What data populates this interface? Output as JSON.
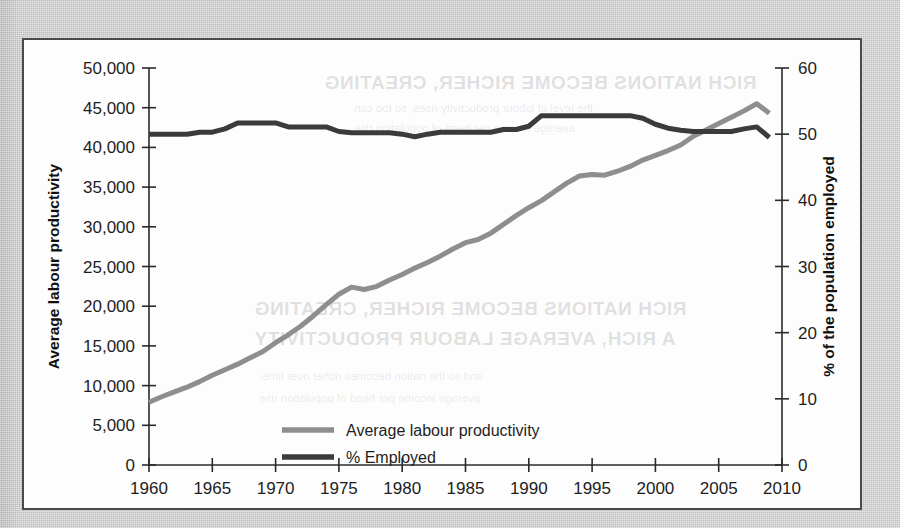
{
  "figure": {
    "background_color": "#cfcfcf",
    "card_color": "#fdfdfd",
    "border_color": "#4a4a4a"
  },
  "ghost_text": {
    "line1": "RICH NATIONS BECOME RICHER, CREATING",
    "line2": "A RICH, AVERAGE LABOUR PRODUCTIVITY",
    "line3": "the level of labour productivity rises, so too can",
    "line4": "average income per head of population rise",
    "line5": "and so the nation becomes richer over time."
  },
  "chart_data": {
    "type": "line",
    "title": "",
    "subtitle": "",
    "xlabel": "",
    "ylabel": "Average labour productivity",
    "y2label": "% of the population employed",
    "grid": false,
    "legend_position": "inside-bottom-right",
    "xlim": [
      1960,
      2010
    ],
    "ylim": [
      0,
      50000
    ],
    "y2lim": [
      0,
      60
    ],
    "xticks": [
      1960,
      1965,
      1970,
      1975,
      1980,
      1985,
      1990,
      1995,
      2000,
      2005,
      2010
    ],
    "xticklabels": [
      "1960",
      "1965",
      "1970",
      "1975",
      "1980",
      "1985",
      "1990",
      "1995",
      "2000",
      "2005",
      "2010"
    ],
    "yticks": [
      0,
      5000,
      10000,
      15000,
      20000,
      25000,
      30000,
      35000,
      40000,
      45000,
      50000
    ],
    "yticklabels": [
      "0",
      "5,000",
      "10,000",
      "15,000",
      "20,000",
      "25,000",
      "30,000",
      "35,000",
      "40,000",
      "45,000",
      "50,000"
    ],
    "y2ticks": [
      0,
      10,
      20,
      30,
      40,
      50,
      60
    ],
    "y2ticklabels": [
      "0",
      "10",
      "20",
      "30",
      "40",
      "50",
      "60"
    ],
    "x": [
      1960,
      1961,
      1962,
      1963,
      1964,
      1965,
      1966,
      1967,
      1968,
      1969,
      1970,
      1971,
      1972,
      1973,
      1974,
      1975,
      1976,
      1977,
      1978,
      1979,
      1980,
      1981,
      1982,
      1983,
      1984,
      1985,
      1986,
      1987,
      1988,
      1989,
      1990,
      1991,
      1992,
      1993,
      1994,
      1995,
      1996,
      1997,
      1998,
      1999,
      2000,
      2001,
      2002,
      2003,
      2004,
      2005,
      2006,
      2007,
      2008,
      2009
    ],
    "series": [
      {
        "name": "Average labour productivity",
        "axis": "left",
        "color": "#8e8e8e",
        "values": [
          7900,
          8600,
          9200,
          9800,
          10500,
          11300,
          12000,
          12700,
          13500,
          14300,
          15400,
          16400,
          17500,
          18800,
          20200,
          21500,
          22400,
          22100,
          22500,
          23300,
          24000,
          24800,
          25500,
          26300,
          27200,
          28000,
          28400,
          29200,
          30300,
          31400,
          32400,
          33300,
          34400,
          35500,
          36400,
          36600,
          36500,
          37000,
          37600,
          38400,
          39000,
          39600,
          40300,
          41400,
          42200,
          43000,
          43800,
          44600,
          45500,
          44300
        ]
      },
      {
        "name": "% Employed",
        "axis": "right",
        "color": "#3b3b3b",
        "values": [
          50.0,
          50.0,
          50.0,
          50.0,
          50.3,
          50.3,
          50.8,
          51.7,
          51.7,
          51.7,
          51.7,
          51.1,
          51.1,
          51.1,
          51.1,
          50.4,
          50.2,
          50.2,
          50.2,
          50.2,
          50.0,
          49.6,
          50.0,
          50.3,
          50.3,
          50.3,
          50.3,
          50.3,
          50.7,
          50.7,
          51.2,
          52.8,
          52.8,
          52.8,
          52.8,
          52.8,
          52.8,
          52.8,
          52.8,
          52.4,
          51.5,
          50.9,
          50.6,
          50.4,
          50.4,
          50.4,
          50.4,
          50.8,
          51.1,
          49.5
        ]
      }
    ],
    "legend": [
      {
        "label": "Average labour productivity",
        "color": "#8e8e8e"
      },
      {
        "label": "% Employed",
        "color": "#3b3b3b"
      }
    ]
  }
}
